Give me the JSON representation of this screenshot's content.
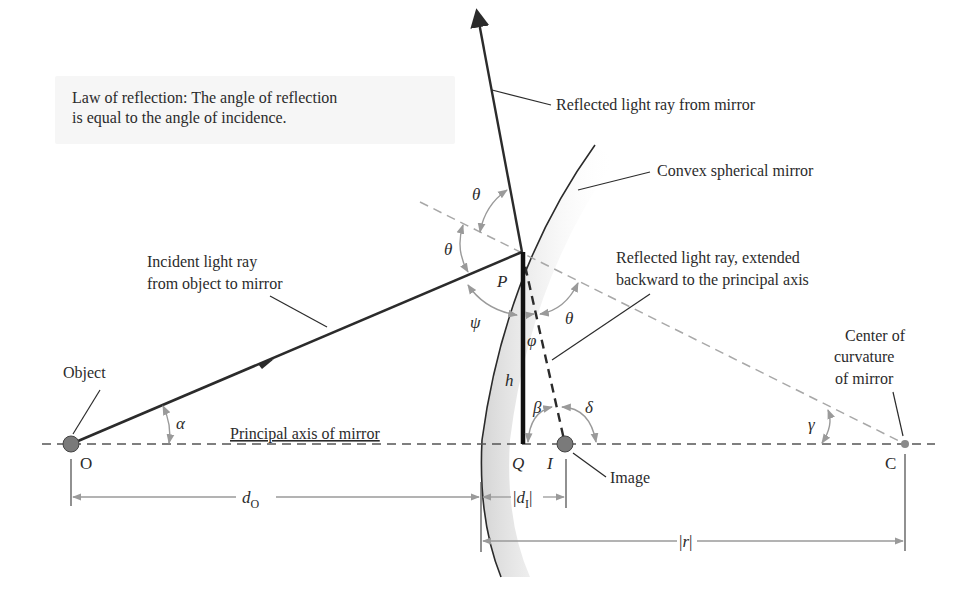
{
  "callout": {
    "line1": "Law of reflection: The angle of reflection",
    "line2": "is equal to the angle of incidence."
  },
  "labels": {
    "reflected_ray": "Reflected light ray from mirror",
    "convex_mirror": "Convex spherical mirror",
    "extended_line1": "Reflected light ray, extended",
    "extended_line2": "backward to the principal axis",
    "incident_line1": "Incident light ray",
    "incident_line2": "from object to mirror",
    "object": "Object",
    "principal_axis": "Principal axis of mirror",
    "center_line1": "Center of",
    "center_line2": "curvature",
    "center_line3": "of mirror",
    "image": "Image"
  },
  "points": {
    "O": "O",
    "P": "P",
    "Q": "Q",
    "I": "I",
    "C": "C"
  },
  "angles": {
    "theta_top": "θ",
    "theta_mid": "θ",
    "theta_right": "θ",
    "psi": "ψ",
    "phi": "φ",
    "alpha": "α",
    "beta": "β",
    "delta": "δ",
    "gamma": "γ"
  },
  "symbols": {
    "h": "h",
    "d_o": "d",
    "d_o_sub": "O",
    "d_i": "d",
    "d_i_sub": "I",
    "r": "r"
  },
  "colors": {
    "ray": "#2b2b2b",
    "dashed_normal": "#a8a8a8",
    "angle_arc": "#9a9a9a",
    "point_fill": "#7a7a7a",
    "callout_bg": "#f6f6f6"
  }
}
